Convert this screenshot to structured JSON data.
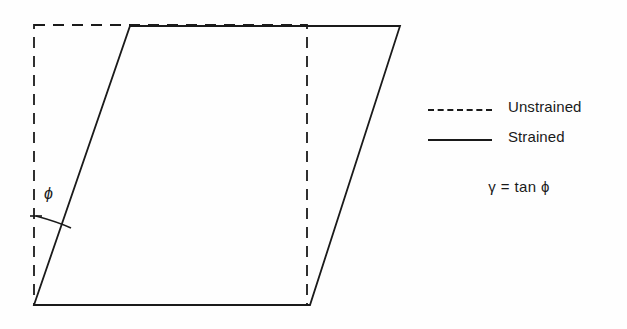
{
  "figure": {
    "background_color": "#fefefe",
    "line_color": "#1a1a1a",
    "angle_label": "ϕ",
    "shapes": {
      "unstrained": {
        "name": "unstrained-rectangle",
        "style": "dashed",
        "points": "34,25 307,25 307,305 34,305"
      },
      "strained": {
        "name": "strained-parallelogram",
        "style": "solid",
        "points": "34,305 130,26 400,26 310,305"
      }
    }
  },
  "legend": {
    "items": [
      {
        "label": "Unstrained",
        "style": "dashed",
        "swatch_name": "dashed-line-swatch"
      },
      {
        "label": "Strained",
        "style": "solid",
        "swatch_name": "solid-line-swatch"
      }
    ],
    "formula": "γ = tan ϕ"
  },
  "chart_data": {
    "type": "diagram",
    "annotations": [
      "ϕ",
      "γ = tan ϕ"
    ],
    "series": [
      {
        "name": "Unstrained",
        "style": "dashed",
        "vertices": [
          [
            34,
            25
          ],
          [
            307,
            25
          ],
          [
            307,
            305
          ],
          [
            34,
            305
          ]
        ]
      },
      {
        "name": "Strained",
        "style": "solid",
        "vertices": [
          [
            34,
            305
          ],
          [
            130,
            26
          ],
          [
            400,
            26
          ],
          [
            310,
            305
          ]
        ]
      }
    ],
    "shear_angle_vertex": [
      34,
      305
    ],
    "xlabel": "",
    "ylabel": "",
    "grid": false,
    "legend_position": "right"
  }
}
